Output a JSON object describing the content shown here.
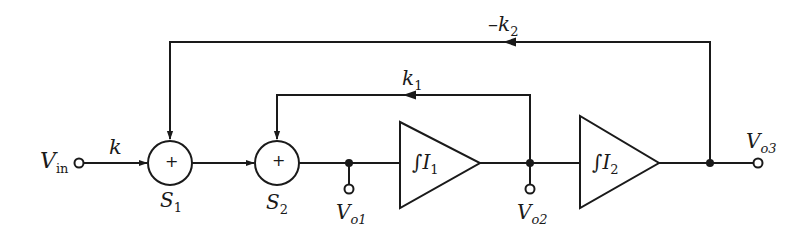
{
  "diagram": {
    "type": "block-diagram",
    "colors": {
      "stroke": "#1a1a1a",
      "background": "#ffffff"
    },
    "input": {
      "label": "V",
      "sub": "in"
    },
    "input_gain": {
      "label": "k"
    },
    "summers": [
      {
        "id": "S1",
        "label": "S",
        "sub": "1",
        "sign": "+"
      },
      {
        "id": "S2",
        "label": "S",
        "sub": "2",
        "sign": "+"
      }
    ],
    "integrators": [
      {
        "id": "I1",
        "symbol": "∫",
        "label": "I",
        "sub": "1"
      },
      {
        "id": "I2",
        "symbol": "∫",
        "label": "I",
        "sub": "2"
      }
    ],
    "outputs": [
      {
        "label": "V",
        "sub": "o1"
      },
      {
        "label": "V",
        "sub": "o2"
      },
      {
        "label": "V",
        "sub": "o3"
      }
    ],
    "feedback": [
      {
        "label": "k",
        "sub": "1",
        "prefix": "",
        "from": "Vo2",
        "to": "S2"
      },
      {
        "label": "k",
        "sub": "2",
        "prefix": "–",
        "from": "Vo3",
        "to": "S1"
      }
    ]
  }
}
